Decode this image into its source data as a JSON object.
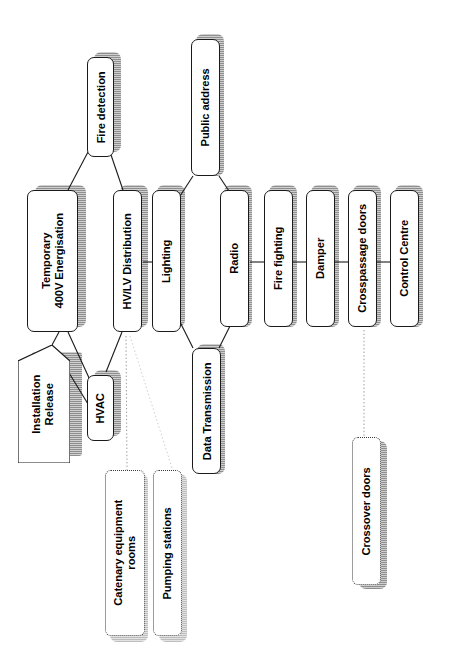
{
  "diagram": {
    "orientation": "rotated-90-ccw",
    "background": "#ffffff",
    "line_color": "#1a1a1a",
    "shadow_color": "#9e9e9e",
    "dotted_line_color": "#9a9a9a"
  },
  "nodes": {
    "installation_release": {
      "label": "Installation\nRelease",
      "shape": "pentagon",
      "style": "solid"
    },
    "temporary_400v": {
      "label": "Temporary\n400V Energisation",
      "shape": "rounded-rect",
      "style": "solid"
    },
    "fire_detection": {
      "label": "Fire detection",
      "shape": "rounded-rect",
      "style": "solid"
    },
    "hvac": {
      "label": "HVAC",
      "shape": "rounded-rect",
      "style": "solid"
    },
    "hv_lv_distribution": {
      "label": "HV/LV Distribution",
      "shape": "rounded-rect",
      "style": "solid"
    },
    "lighting": {
      "label": "Lighting",
      "shape": "rounded-rect",
      "style": "solid"
    },
    "public_address": {
      "label": "Public address",
      "shape": "rounded-rect",
      "style": "solid"
    },
    "radio": {
      "label": "Radio",
      "shape": "rounded-rect",
      "style": "solid"
    },
    "data_transmission": {
      "label": "Data Transmission",
      "shape": "rounded-rect",
      "style": "solid"
    },
    "fire_fighting": {
      "label": "Fire fighting",
      "shape": "rounded-rect",
      "style": "solid"
    },
    "damper": {
      "label": "Damper",
      "shape": "rounded-rect",
      "style": "solid"
    },
    "crosspassage_doors": {
      "label": "Crosspassage doors",
      "shape": "rounded-rect",
      "style": "solid"
    },
    "control_centre": {
      "label": "Control Centre",
      "shape": "rounded-rect",
      "style": "solid"
    },
    "catenary_rooms": {
      "label": "Catenary equipment\nrooms",
      "shape": "rounded-rect",
      "style": "dotted"
    },
    "pumping_stations": {
      "label": "Pumping stations",
      "shape": "rounded-rect",
      "style": "dotted"
    },
    "crossover_doors": {
      "label": "Crossover doors",
      "shape": "rounded-rect",
      "style": "dotted"
    }
  },
  "edges": [
    {
      "from": "installation_release",
      "to": "temporary_400v",
      "style": "solid"
    },
    {
      "from": "installation_release",
      "to": "hvac",
      "style": "solid"
    },
    {
      "from": "temporary_400v",
      "to": "fire_detection",
      "style": "solid"
    },
    {
      "from": "temporary_400v",
      "to": "hvac",
      "style": "solid"
    },
    {
      "from": "fire_detection",
      "to": "hv_lv_distribution",
      "style": "solid"
    },
    {
      "from": "hv_lv_distribution",
      "to": "hvac",
      "style": "solid"
    },
    {
      "from": "hv_lv_distribution",
      "to": "lighting",
      "style": "solid"
    },
    {
      "from": "hv_lv_distribution",
      "to": "catenary_rooms",
      "style": "dotted"
    },
    {
      "from": "hv_lv_distribution",
      "to": "pumping_stations",
      "style": "dotted"
    },
    {
      "from": "lighting",
      "to": "public_address",
      "style": "solid"
    },
    {
      "from": "lighting",
      "to": "data_transmission",
      "style": "solid"
    },
    {
      "from": "public_address",
      "to": "radio",
      "style": "solid"
    },
    {
      "from": "data_transmission",
      "to": "radio",
      "style": "solid"
    },
    {
      "from": "radio",
      "to": "fire_fighting",
      "style": "solid"
    },
    {
      "from": "fire_fighting",
      "to": "damper",
      "style": "solid"
    },
    {
      "from": "damper",
      "to": "crosspassage_doors",
      "style": "solid"
    },
    {
      "from": "crosspassage_doors",
      "to": "control_centre",
      "style": "solid"
    },
    {
      "from": "crosspassage_doors",
      "to": "crossover_doors",
      "style": "dotted"
    }
  ]
}
